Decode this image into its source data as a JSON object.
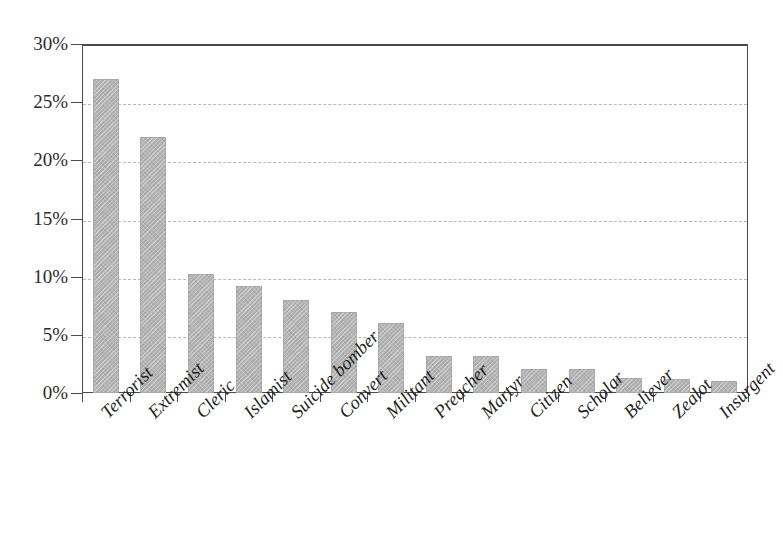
{
  "chart_data": {
    "type": "bar",
    "title": "",
    "subtitle": "",
    "xlabel": "",
    "ylabel": "",
    "categories": [
      "Terrorist",
      "Extremist",
      "Cleric",
      "Islamist",
      "Suicide bomber",
      "Convert",
      "Militant",
      "Preacher",
      "Martyr",
      "Citizen",
      "Scholar",
      "Believer",
      "Zealot",
      "Insurgent"
    ],
    "values": [
      27,
      22,
      10.2,
      9.2,
      8,
      7,
      6,
      3.2,
      3.2,
      2.1,
      2.1,
      1.3,
      1.2,
      1
    ],
    "value_unit": "%",
    "ylim": [
      0,
      30
    ],
    "ytick_values": [
      0,
      5,
      10,
      15,
      20,
      25,
      30
    ],
    "ytick_labels": [
      "0%",
      "5%",
      "10%",
      "15%",
      "20%",
      "25%",
      "30%"
    ],
    "grid": "horizontal-dashed",
    "legend": "none",
    "bar_color": "#b4b4b4",
    "axis_color": "#4a4a4a",
    "gridline_color": "#b9b9b9",
    "xtick_label_rotation": -45
  }
}
